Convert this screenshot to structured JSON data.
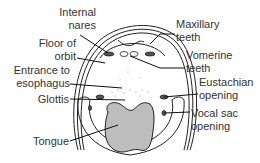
{
  "diagram": {
    "labels_left": [
      {
        "id": "internal-nares",
        "lines": [
          "Internal",
          "nares"
        ]
      },
      {
        "id": "floor-of-orbit",
        "lines": [
          "Floor of",
          "orbit"
        ]
      },
      {
        "id": "entrance-to-esophagus",
        "lines": [
          "Entrance to",
          "esophagus"
        ]
      },
      {
        "id": "glottis",
        "lines": [
          "Glottis"
        ]
      },
      {
        "id": "tongue",
        "lines": [
          "Tongue"
        ]
      }
    ],
    "labels_right": [
      {
        "id": "maxillary-teeth",
        "lines": [
          "Maxillary",
          "teeth"
        ]
      },
      {
        "id": "vomerine-teeth",
        "lines": [
          "Vomerine",
          "teeth"
        ]
      },
      {
        "id": "eustachian-opening",
        "lines": [
          "Eustachian",
          "opening"
        ]
      },
      {
        "id": "vocal-sac-opening",
        "lines": [
          "Vocal sac",
          "opening"
        ]
      }
    ],
    "colors": {
      "line": "#222222",
      "tongue_fill": "#bdbdbd",
      "text": "#333333",
      "background": "#ffffff"
    }
  }
}
